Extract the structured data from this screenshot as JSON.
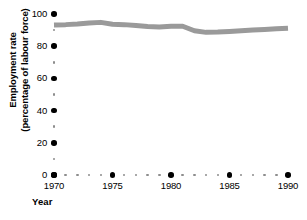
{
  "chart_data": {
    "type": "line",
    "title": "",
    "xlabel": "Year",
    "ylabel": "Employment rate (percentage of labour force)",
    "ylabel_lines": [
      "Employment rate",
      "(percentage of labour force)"
    ],
    "xlim": [
      1970,
      1990
    ],
    "ylim": [
      0,
      100
    ],
    "grid": false,
    "legend": "none",
    "line_color": "#9a9a9a",
    "line_width_px": 5,
    "marker_color": "#000000",
    "minor_marker_color": "#8d8d8d",
    "y_ticks_major": [
      0,
      20,
      40,
      60,
      80,
      100
    ],
    "y_ticks_major_labels": [
      "0",
      "20",
      "40",
      "60",
      "80",
      "100"
    ],
    "y_ticks_minor": [
      10,
      30,
      50,
      70,
      90
    ],
    "x_ticks_major": [
      1970,
      1975,
      1980,
      1985,
      1990
    ],
    "x_ticks_major_labels": [
      "1970",
      "1975",
      "1980",
      "1985",
      "1990"
    ],
    "x_ticks_minor": [
      1971,
      1972,
      1973,
      1974,
      1976,
      1977,
      1978,
      1979,
      1981,
      1982,
      1983,
      1984,
      1986,
      1987,
      1988,
      1989
    ],
    "x": [
      1970,
      1971,
      1972,
      1973,
      1974,
      1975,
      1976,
      1977,
      1978,
      1979,
      1980,
      1981,
      1982,
      1983,
      1984,
      1985,
      1986,
      1987,
      1988,
      1989,
      1990
    ],
    "series": [
      {
        "name": "Employment rate",
        "values": [
          93.2,
          93.4,
          93.8,
          94.4,
          94.8,
          93.6,
          93.4,
          92.8,
          92.2,
          92.0,
          92.4,
          92.4,
          89.6,
          88.6,
          88.8,
          89.2,
          89.6,
          90.0,
          90.4,
          90.8,
          91.2
        ]
      }
    ]
  },
  "axes": {
    "y_title_line1": "Employment rate",
    "y_title_line2": "(percentage of labour force)",
    "x_title": "Year"
  }
}
